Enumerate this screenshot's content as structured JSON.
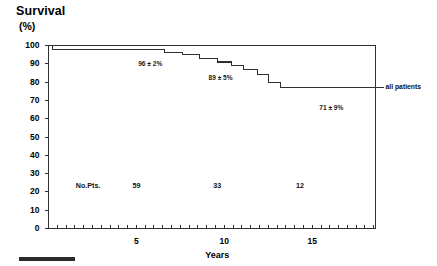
{
  "chart_data": {
    "type": "line",
    "title": "Survival",
    "subtitle": "(%)",
    "xlabel": "Years",
    "ylabel": "(%)",
    "xlim": [
      0,
      18.6
    ],
    "ylim": [
      0,
      100
    ],
    "grid": false,
    "legend_position": "right-outside",
    "ytick_labels": [
      "0",
      "10",
      "20",
      "30",
      "40",
      "50",
      "60",
      "70",
      "80",
      "90",
      "100"
    ],
    "ytick_values": [
      0,
      10,
      20,
      30,
      40,
      50,
      60,
      70,
      80,
      90,
      100
    ],
    "xtick_labels": [
      "5",
      "10",
      "15"
    ],
    "xtick_values": [
      5,
      10,
      15
    ],
    "x_minor_tick_interval": 0.5,
    "series": [
      {
        "name": "all patients",
        "step_type": "post",
        "x": [
          0.0,
          0.25,
          3.7,
          6.6,
          7.6,
          8.6,
          9.6,
          10.4,
          11.1,
          11.9,
          12.5,
          13.2,
          16.1,
          18.6
        ],
        "y": [
          100,
          98,
          98,
          96,
          95,
          93,
          91,
          89,
          87,
          84,
          80,
          77,
          77,
          71
        ]
      }
    ],
    "annotations": [
      {
        "text": "96 ± 2%",
        "x": 5.1,
        "y": 91.5
      },
      {
        "text": "89 ± 5%",
        "x": 9.1,
        "y": 84.0
      },
      {
        "text": "71 ± 9%",
        "x": 15.4,
        "y": 67.5
      }
    ],
    "series_labels": [
      {
        "text": "all patients",
        "x": 19.3,
        "y": 77
      }
    ],
    "risk_table": {
      "label": "No.Pts.",
      "y": 23,
      "entries": [
        {
          "x": 5.0,
          "value": "59"
        },
        {
          "x": 9.6,
          "value": "33"
        },
        {
          "x": 14.3,
          "value": "12"
        }
      ]
    },
    "colors": {
      "axis": "#303030",
      "curve": "#303030",
      "text": "#111111",
      "background": "#ffffff"
    }
  }
}
